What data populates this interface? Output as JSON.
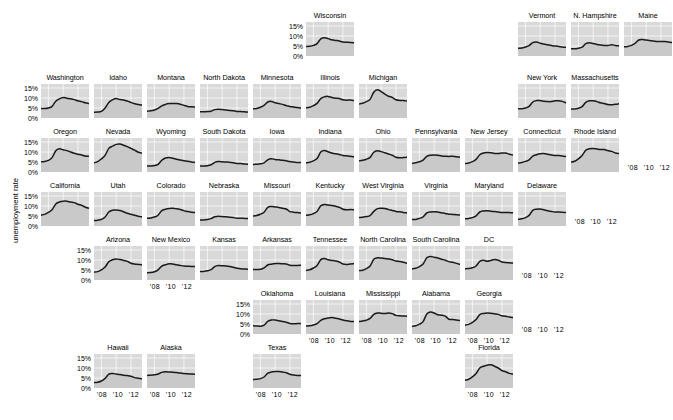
{
  "figure": {
    "ylabel": "unemployment rate",
    "ytick_labels": [
      "15%",
      "10%",
      "5%",
      "0%"
    ],
    "ytick_values": [
      15,
      10,
      5,
      0
    ],
    "xtick_labels": [
      "'08",
      "'10",
      "'12"
    ],
    "xtick_values": [
      2008,
      2010,
      2012
    ],
    "panel_fill": "#d9d9d9",
    "grid_color": "#ffffff",
    "line_color": "#1a1a1a",
    "background": "#ffffff"
  },
  "chart_data": {
    "type": "line",
    "title": "",
    "xlabel": "",
    "ylabel": "unemployment rate",
    "xlim": [
      2007.0,
      2013.5
    ],
    "ylim": [
      0,
      17
    ],
    "grid": true,
    "legend": "none",
    "layout": "geographic small multiples (US state grid)",
    "x": [
      2007.0,
      2007.5,
      2008.0,
      2008.5,
      2009.0,
      2009.5,
      2010.0,
      2010.5,
      2011.0,
      2011.5,
      2012.0,
      2012.5,
      2013.0,
      2013.5
    ],
    "series": [
      {
        "name": "Washington",
        "row": 2,
        "col": 0,
        "values": [
          4.8,
          4.7,
          5.0,
          5.8,
          8.4,
          9.6,
          10.3,
          9.9,
          9.6,
          9.2,
          8.6,
          8.2,
          7.6,
          7.2
        ]
      },
      {
        "name": "Idaho",
        "row": 2,
        "col": 1,
        "values": [
          2.9,
          3.0,
          3.3,
          5.0,
          7.8,
          9.1,
          9.7,
          9.2,
          9.0,
          8.5,
          7.8,
          7.1,
          6.7,
          6.4
        ]
      },
      {
        "name": "Montana",
        "row": 2,
        "col": 2,
        "values": [
          3.4,
          3.6,
          4.0,
          4.8,
          6.1,
          6.8,
          7.2,
          7.3,
          7.2,
          6.9,
          6.3,
          5.8,
          5.6,
          5.5
        ]
      },
      {
        "name": "North Dakota",
        "row": 2,
        "col": 3,
        "values": [
          3.1,
          3.1,
          3.2,
          3.4,
          4.2,
          4.4,
          4.2,
          4.0,
          3.8,
          3.6,
          3.3,
          3.2,
          3.1,
          3.0
        ]
      },
      {
        "name": "Minnesota",
        "row": 2,
        "col": 4,
        "values": [
          4.6,
          4.8,
          5.4,
          6.3,
          8.0,
          8.3,
          7.6,
          7.2,
          6.8,
          6.2,
          5.8,
          5.5,
          5.2,
          5.0
        ]
      },
      {
        "name": "Illinois",
        "row": 2,
        "col": 5,
        "values": [
          5.1,
          5.4,
          6.2,
          7.3,
          9.7,
          10.6,
          10.8,
          10.3,
          9.9,
          9.7,
          9.1,
          8.9,
          9.0,
          8.7
        ]
      },
      {
        "name": "Michigan",
        "row": 2,
        "col": 6,
        "values": [
          7.0,
          7.4,
          8.2,
          9.3,
          12.9,
          14.1,
          13.2,
          11.9,
          10.9,
          10.3,
          9.1,
          8.8,
          8.8,
          8.5
        ]
      },
      {
        "name": "Wisconsin",
        "row": 1,
        "col": 5,
        "values": [
          4.8,
          4.9,
          5.3,
          6.2,
          8.6,
          9.1,
          8.7,
          8.1,
          7.8,
          7.5,
          7.0,
          6.9,
          6.8,
          6.6
        ]
      },
      {
        "name": "Vermont",
        "row": 1,
        "col": 9,
        "values": [
          3.9,
          4.0,
          4.5,
          5.2,
          6.7,
          7.0,
          6.4,
          6.0,
          5.6,
          5.2,
          5.0,
          4.8,
          4.5,
          4.3
        ]
      },
      {
        "name": "N. Hampshire",
        "row": 1,
        "col": 10,
        "values": [
          3.6,
          3.6,
          3.9,
          4.4,
          6.2,
          6.6,
          6.2,
          5.8,
          5.5,
          5.3,
          5.3,
          5.6,
          5.3,
          5.1
        ]
      },
      {
        "name": "Maine",
        "row": 1,
        "col": 11,
        "values": [
          4.6,
          4.8,
          5.3,
          6.3,
          8.0,
          8.2,
          8.0,
          7.7,
          7.5,
          7.3,
          7.2,
          7.2,
          7.0,
          6.8
        ]
      },
      {
        "name": "New York",
        "row": 2,
        "col": 9,
        "values": [
          4.6,
          4.6,
          5.0,
          5.8,
          8.0,
          8.7,
          8.7,
          8.4,
          8.2,
          8.2,
          8.6,
          8.6,
          8.3,
          7.6
        ]
      },
      {
        "name": "Massachusetts",
        "row": 2,
        "col": 10,
        "values": [
          4.5,
          4.5,
          4.9,
          5.7,
          7.8,
          8.6,
          8.6,
          8.2,
          7.6,
          7.2,
          6.7,
          6.6,
          6.9,
          7.1
        ]
      },
      {
        "name": "Oregon",
        "row": 3,
        "col": 0,
        "values": [
          5.1,
          5.3,
          5.8,
          7.2,
          10.6,
          11.6,
          11.1,
          10.7,
          10.0,
          9.4,
          8.9,
          8.5,
          8.0,
          7.9
        ]
      },
      {
        "name": "Nevada",
        "row": 3,
        "col": 1,
        "values": [
          4.6,
          5.2,
          6.6,
          8.3,
          11.8,
          12.9,
          13.8,
          14.0,
          13.4,
          12.7,
          11.8,
          10.9,
          9.9,
          9.5
        ]
      },
      {
        "name": "Wyoming",
        "row": 3,
        "col": 2,
        "values": [
          3.0,
          3.0,
          3.2,
          3.8,
          5.9,
          7.0,
          7.3,
          6.9,
          6.4,
          6.0,
          5.6,
          5.4,
          5.0,
          4.8
        ]
      },
      {
        "name": "South Dakota",
        "row": 3,
        "col": 3,
        "values": [
          3.0,
          3.0,
          3.1,
          3.6,
          4.8,
          5.2,
          5.1,
          5.0,
          4.9,
          4.6,
          4.3,
          4.2,
          4.0,
          3.9
        ]
      },
      {
        "name": "Iowa",
        "row": 3,
        "col": 4,
        "values": [
          3.8,
          3.9,
          4.1,
          4.6,
          6.1,
          6.6,
          6.3,
          6.1,
          5.9,
          5.6,
          5.2,
          5.0,
          4.8,
          4.7
        ]
      },
      {
        "name": "Indiana",
        "row": 3,
        "col": 5,
        "values": [
          4.6,
          4.9,
          5.6,
          6.7,
          10.0,
          10.7,
          10.1,
          9.5,
          9.1,
          8.8,
          8.3,
          8.1,
          7.9,
          7.6
        ]
      },
      {
        "name": "Ohio",
        "row": 3,
        "col": 6,
        "values": [
          5.6,
          5.9,
          6.4,
          7.3,
          9.9,
          10.6,
          10.2,
          9.6,
          9.0,
          8.4,
          7.4,
          7.1,
          7.2,
          7.4
        ]
      },
      {
        "name": "Pennsylvania",
        "row": 3,
        "col": 7,
        "values": [
          4.3,
          4.6,
          5.1,
          5.9,
          7.8,
          8.4,
          8.5,
          8.4,
          8.0,
          7.9,
          7.8,
          7.9,
          7.6,
          7.4
        ]
      },
      {
        "name": "New Jersey",
        "row": 3,
        "col": 8,
        "values": [
          4.2,
          4.5,
          5.2,
          6.3,
          8.6,
          9.5,
          9.7,
          9.6,
          9.3,
          9.2,
          9.5,
          9.5,
          8.9,
          8.5
        ]
      },
      {
        "name": "Connecticut",
        "row": 3,
        "col": 9,
        "values": [
          4.5,
          4.8,
          5.3,
          6.1,
          7.9,
          8.6,
          9.1,
          9.2,
          8.9,
          8.5,
          8.3,
          8.2,
          8.0,
          7.7
        ]
      },
      {
        "name": "Rhode Island",
        "row": 3,
        "col": 10,
        "values": [
          5.0,
          5.4,
          6.6,
          8.3,
          10.9,
          11.6,
          11.7,
          11.5,
          11.3,
          11.2,
          10.7,
          10.3,
          9.5,
          9.2
        ]
      },
      {
        "name": "California",
        "row": 4,
        "col": 0,
        "values": [
          5.4,
          5.8,
          6.8,
          8.1,
          11.0,
          12.0,
          12.4,
          12.4,
          12.0,
          11.7,
          10.9,
          10.3,
          9.4,
          8.9
        ]
      },
      {
        "name": "Utah",
        "row": 4,
        "col": 1,
        "values": [
          2.7,
          2.9,
          3.3,
          4.5,
          7.0,
          7.9,
          8.0,
          7.7,
          7.1,
          6.4,
          5.9,
          5.4,
          4.9,
          4.6
        ]
      },
      {
        "name": "Colorado",
        "row": 4,
        "col": 2,
        "values": [
          3.9,
          4.0,
          4.5,
          5.4,
          7.7,
          8.4,
          8.8,
          8.9,
          8.6,
          8.2,
          7.7,
          7.2,
          6.9,
          6.8
        ]
      },
      {
        "name": "Nebraska",
        "row": 4,
        "col": 3,
        "values": [
          3.0,
          3.0,
          3.2,
          3.7,
          4.6,
          4.9,
          4.7,
          4.6,
          4.4,
          4.2,
          3.9,
          3.9,
          3.8,
          3.7
        ]
      },
      {
        "name": "Missouri",
        "row": 4,
        "col": 4,
        "values": [
          5.0,
          5.3,
          5.9,
          6.9,
          9.3,
          9.7,
          9.5,
          9.3,
          8.9,
          8.5,
          7.2,
          6.9,
          6.7,
          6.5
        ]
      },
      {
        "name": "Kentucky",
        "row": 4,
        "col": 5,
        "values": [
          5.4,
          5.6,
          6.2,
          7.3,
          10.1,
          10.8,
          10.5,
          10.3,
          9.9,
          9.4,
          8.4,
          8.1,
          8.2,
          8.1
        ]
      },
      {
        "name": "West Virginia",
        "row": 4,
        "col": 6,
        "values": [
          4.3,
          4.4,
          4.7,
          5.2,
          7.3,
          8.7,
          8.9,
          8.8,
          8.2,
          7.8,
          7.3,
          7.1,
          6.8,
          6.6
        ]
      },
      {
        "name": "Virginia",
        "row": 4,
        "col": 7,
        "values": [
          3.2,
          3.3,
          3.8,
          4.6,
          6.5,
          7.0,
          7.1,
          7.0,
          6.6,
          6.3,
          5.9,
          5.8,
          5.6,
          5.5
        ]
      },
      {
        "name": "Maryland",
        "row": 4,
        "col": 8,
        "values": [
          3.6,
          3.8,
          4.2,
          5.1,
          7.0,
          7.5,
          7.6,
          7.4,
          7.2,
          7.0,
          6.8,
          6.8,
          6.7,
          6.6
        ]
      },
      {
        "name": "Delaware",
        "row": 4,
        "col": 9,
        "values": [
          3.4,
          3.6,
          4.2,
          5.3,
          7.8,
          8.4,
          8.5,
          8.1,
          7.6,
          7.3,
          7.0,
          7.0,
          6.9,
          6.7
        ]
      },
      {
        "name": "Arizona",
        "row": 5,
        "col": 1,
        "values": [
          3.9,
          4.2,
          5.1,
          6.5,
          9.1,
          10.1,
          10.5,
          10.2,
          9.8,
          9.3,
          8.4,
          8.0,
          7.8,
          7.6
        ]
      },
      {
        "name": "New Mexico",
        "row": 5,
        "col": 2,
        "values": [
          3.6,
          3.7,
          4.1,
          5.1,
          6.9,
          7.6,
          8.1,
          8.0,
          7.6,
          7.3,
          7.0,
          6.9,
          6.8,
          6.7
        ]
      },
      {
        "name": "Kansas",
        "row": 5,
        "col": 3,
        "values": [
          4.2,
          4.3,
          4.6,
          5.2,
          6.7,
          7.2,
          7.1,
          7.0,
          6.8,
          6.4,
          5.9,
          5.6,
          5.5,
          5.4
        ]
      },
      {
        "name": "Arkansas",
        "row": 5,
        "col": 4,
        "values": [
          5.3,
          5.3,
          5.4,
          6.1,
          7.5,
          7.9,
          8.2,
          8.2,
          8.1,
          8.0,
          7.4,
          7.3,
          7.3,
          7.4
        ]
      },
      {
        "name": "Tennessee",
        "row": 5,
        "col": 5,
        "values": [
          4.8,
          5.1,
          6.0,
          7.3,
          10.2,
          10.8,
          10.1,
          9.8,
          9.5,
          9.0,
          8.0,
          7.8,
          8.0,
          8.1
        ]
      },
      {
        "name": "North Carolina",
        "row": 5,
        "col": 6,
        "values": [
          4.7,
          4.9,
          5.7,
          7.0,
          10.4,
          11.1,
          11.0,
          10.7,
          10.5,
          10.1,
          9.5,
          9.3,
          8.9,
          8.3
        ]
      },
      {
        "name": "South Carolina",
        "row": 5,
        "col": 7,
        "values": [
          5.6,
          5.9,
          6.7,
          8.0,
          11.1,
          11.8,
          11.4,
          11.0,
          10.4,
          9.9,
          9.2,
          8.9,
          8.3,
          7.8
        ]
      },
      {
        "name": "DC",
        "row": 5,
        "col": 8,
        "values": [
          5.6,
          5.7,
          6.1,
          7.0,
          9.3,
          9.9,
          9.4,
          9.8,
          10.2,
          9.9,
          9.0,
          8.7,
          8.6,
          8.5
        ]
      },
      {
        "name": "Oklahoma",
        "row": 6,
        "col": 4,
        "values": [
          4.2,
          4.0,
          3.9,
          4.4,
          6.3,
          7.0,
          7.0,
          6.6,
          6.2,
          5.9,
          5.3,
          5.1,
          5.2,
          5.3
        ]
      },
      {
        "name": "Louisiana",
        "row": 6,
        "col": 5,
        "values": [
          4.0,
          4.1,
          4.5,
          5.2,
          6.8,
          7.6,
          8.0,
          8.2,
          7.9,
          7.5,
          7.0,
          6.6,
          6.3,
          6.2
        ]
      },
      {
        "name": "Mississippi",
        "row": 6,
        "col": 6,
        "values": [
          6.2,
          6.5,
          6.9,
          7.8,
          9.8,
          10.5,
          10.4,
          10.2,
          10.5,
          10.2,
          9.3,
          9.1,
          9.0,
          8.9
        ]
      },
      {
        "name": "Alabama",
        "row": 6,
        "col": 7,
        "values": [
          3.8,
          4.1,
          4.9,
          6.2,
          10.0,
          11.0,
          10.5,
          9.6,
          9.4,
          8.9,
          7.4,
          7.2,
          7.0,
          6.8
        ]
      },
      {
        "name": "Georgia",
        "row": 6,
        "col": 8,
        "values": [
          4.4,
          4.8,
          5.8,
          7.2,
          9.7,
          10.3,
          10.5,
          10.4,
          10.1,
          9.8,
          9.1,
          8.9,
          8.5,
          8.2
        ]
      },
      {
        "name": "Hawaii",
        "row": 7,
        "col": 1,
        "values": [
          2.7,
          2.9,
          3.5,
          4.8,
          6.9,
          7.2,
          7.0,
          6.7,
          6.4,
          6.2,
          5.9,
          5.2,
          4.9,
          4.6
        ]
      },
      {
        "name": "Alaska",
        "row": 7,
        "col": 2,
        "values": [
          6.2,
          6.4,
          6.6,
          7.0,
          7.8,
          8.1,
          8.0,
          7.9,
          7.7,
          7.5,
          7.2,
          7.1,
          7.0,
          6.9
        ]
      },
      {
        "name": "Texas",
        "row": 7,
        "col": 4,
        "values": [
          4.3,
          4.4,
          4.7,
          5.5,
          7.4,
          8.0,
          8.2,
          8.2,
          8.0,
          7.6,
          6.9,
          6.5,
          6.3,
          6.2
        ]
      },
      {
        "name": "Florida",
        "row": 7,
        "col": 8,
        "values": [
          3.9,
          4.4,
          5.6,
          7.2,
          10.0,
          10.9,
          11.4,
          11.6,
          10.9,
          10.0,
          8.7,
          8.1,
          7.3,
          7.0
        ]
      }
    ]
  }
}
